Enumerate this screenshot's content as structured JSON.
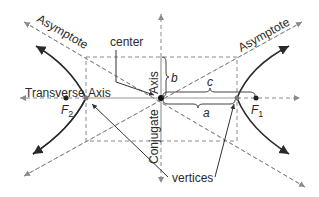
{
  "diagram": {
    "labels": {
      "asymptote_left": "Asymptote",
      "asymptote_right": "Asymptote",
      "center": "center",
      "transverse": "Transverse",
      "transverse_axis": "Axis",
      "conjugate": "Conjugate",
      "conjugate_axis": "Axis",
      "vertices": "vertices",
      "b": "b",
      "c": "c",
      "a": "a",
      "f1_letter": "F",
      "f1_sub": "1",
      "f2_letter": "F",
      "f2_sub": "2"
    },
    "colors": {
      "curve": "#2a2a2a",
      "dashed": "#8a8a8a",
      "text": "#2a2a2a"
    }
  }
}
